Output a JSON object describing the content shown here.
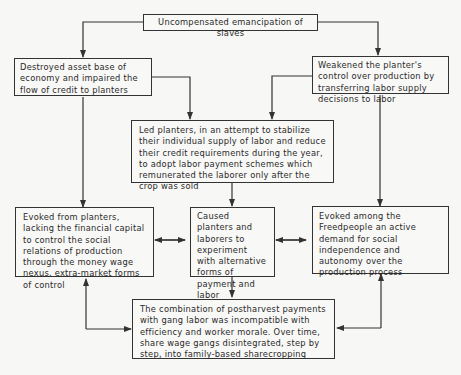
{
  "diagram": {
    "type": "flowchart",
    "nodes": {
      "root": "Uncompensated emancipation of slaves",
      "left_top": "Destroyed asset base of economy and impaired the flow of credit to planters",
      "right_top": "Weakened the planter's control over production by transferring labor supply decisions to labor",
      "middle": "Led planters, in an attempt to stabilize their individual supply of labor and reduce their credit requirements during the year, to adopt labor payment schemes which remunerated the laborer only after the crop was sold",
      "left_mid": "Evoked from planters, lacking the financial capital to control the social relations of production through the money wage nexus, extra-market forms of control",
      "center_mid": "Caused planters and laborers to experiment with alternative forms of payment and labor organization",
      "right_mid": "Evoked among the Freedpeople an active demand for social independence and autonomy over the production process",
      "bottom": "The combination of postharvest payments with gang labor was incompatible with efficiency and worker morale. Over time, share wage gangs disintegrated, step by step, into family-based sharecropping"
    },
    "edges": [
      {
        "from": "root",
        "to": "left_top"
      },
      {
        "from": "root",
        "to": "right_top"
      },
      {
        "from": "left_top",
        "to": "middle"
      },
      {
        "from": "right_top",
        "to": "middle"
      },
      {
        "from": "left_top",
        "to": "left_mid"
      },
      {
        "from": "right_top",
        "to": "right_mid"
      },
      {
        "from": "middle",
        "to": "center_mid"
      },
      {
        "from": "left_mid",
        "to": "center_mid",
        "bidirectional": true
      },
      {
        "from": "center_mid",
        "to": "right_mid",
        "bidirectional": true
      },
      {
        "from": "center_mid",
        "to": "bottom"
      },
      {
        "from": "bottom",
        "to": "left_mid",
        "bidirectional": true
      },
      {
        "from": "bottom",
        "to": "right_mid",
        "bidirectional": true
      }
    ]
  }
}
